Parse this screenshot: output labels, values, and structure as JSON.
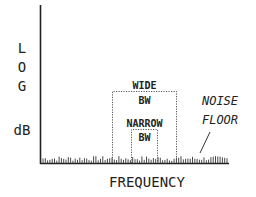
{
  "diagram": {
    "y_axis_label_lines": [
      "L",
      "O",
      "G",
      "dB"
    ],
    "x_axis_label": "FREQUENCY",
    "wide_box": {
      "line1": "WIDE",
      "line2": "BW"
    },
    "narrow_box": {
      "line1": "NARROW",
      "line2": "BW"
    },
    "annotation": {
      "line1": "NOISE",
      "line2": "FLOOR"
    },
    "colors": {
      "ink": "#222222",
      "background": "#ffffff"
    }
  }
}
